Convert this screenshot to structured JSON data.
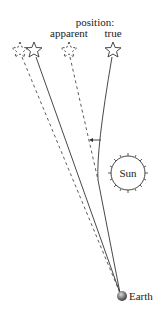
{
  "diagram": {
    "heading": "position:",
    "labels": {
      "apparent": "apparent",
      "true": "true",
      "sun": "Sun",
      "earth": "Earth"
    },
    "elements": {
      "stars": [
        {
          "id": "apparent-far",
          "style": "dashed",
          "x": 20,
          "y": 50
        },
        {
          "id": "true-far",
          "style": "solid",
          "x": 34,
          "y": 50
        },
        {
          "id": "apparent-near",
          "style": "dashed",
          "x": 69,
          "y": 50
        },
        {
          "id": "true-near",
          "style": "solid",
          "x": 113,
          "y": 50
        }
      ],
      "sun": {
        "cx": 128,
        "cy": 173,
        "r": 17
      },
      "earth": {
        "cx": 122,
        "cy": 296
      }
    },
    "colors": {
      "line": "#333333",
      "earth": "#6b6b6b"
    }
  }
}
